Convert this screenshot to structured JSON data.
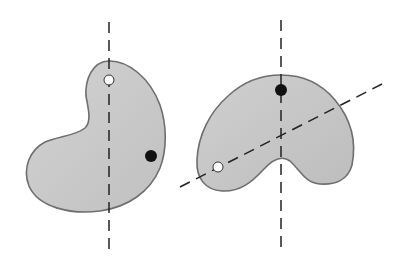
{
  "diagram": {
    "colors": {
      "background": "#ffffff",
      "shape_fill": "#c9c9c9",
      "shape_stroke": "#6e6e6e",
      "dash_line": "#222222",
      "pivot_hole": "#ffffff",
      "mass_dot": "#111111"
    },
    "left_figure": {
      "shape": "kidney-lamina",
      "pivot_hole": {
        "cx": 109,
        "cy": 80,
        "r": 5
      },
      "mass_dot": {
        "cx": 151,
        "cy": 156,
        "r": 6
      },
      "plumb_line": {
        "x1": 109,
        "y1": 22,
        "x2": 109,
        "y2": 252
      }
    },
    "right_figure": {
      "shape": "bean-lamina",
      "pivot_hole": {
        "cx": 218,
        "cy": 167,
        "r": 5
      },
      "mass_dot": {
        "cx": 281,
        "cy": 90,
        "r": 6
      },
      "plumb_line_vertical": {
        "x1": 281,
        "y1": 20,
        "x2": 281,
        "y2": 250
      },
      "plumb_line_diagonal": {
        "x1": 180,
        "y1": 187,
        "x2": 382,
        "y2": 84
      }
    }
  }
}
